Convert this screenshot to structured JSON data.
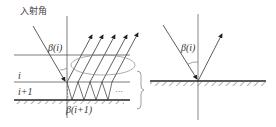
{
  "left_panel": {
    "incident_label": "入射角",
    "beta_i_label": "β(i)",
    "beta_i1_label": "β(i+1)",
    "layer_i_label": "i",
    "layer_i1_label": "i+1",
    "ellipsis": "···"
  },
  "right_panel": {
    "beta_i_label": "β(i)"
  },
  "colors": {
    "line": "#333333",
    "hatch": "#555555",
    "ellipse": "#777777"
  }
}
